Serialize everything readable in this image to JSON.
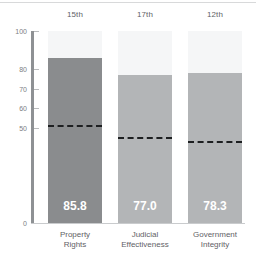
{
  "chart_data": {
    "type": "bar",
    "title": "",
    "subtitle": "",
    "xlabel": "",
    "ylabel": "",
    "ylim": [
      0,
      100
    ],
    "grid": false,
    "legend_position": "none",
    "categories": [
      "Property Rights",
      "Judicial Effectiveness",
      "Government Integrity"
    ],
    "category_lines": [
      [
        "Property",
        "Rights"
      ],
      [
        "Judicial",
        "Effectiveness"
      ],
      [
        "Government",
        "Integrity"
      ]
    ],
    "values": [
      85.8,
      77.0,
      78.3
    ],
    "value_labels": [
      "85.8",
      "77.0",
      "78.3"
    ],
    "rank_labels": [
      "15th",
      "17th",
      "12th"
    ],
    "reference_markers": {
      "style": "dashed",
      "values": [
        51.3,
        45.0,
        42.5
      ]
    },
    "y_ticks": [
      100,
      80,
      70,
      60,
      50,
      0
    ],
    "y_tick_labels": [
      "100",
      "80",
      "70",
      "60",
      "50",
      "0"
    ],
    "colors": {
      "bar_primary": "#8a8c8e",
      "bar_secondary": "#b3b5b7",
      "column_background": "#f5f6f7",
      "axis": "#8e9194",
      "tick_text": "#7b7e82",
      "label_text": "#5f6266",
      "marker": "#1d1f21",
      "value_text": "#ffffff",
      "page_background": "#ffffff"
    }
  }
}
